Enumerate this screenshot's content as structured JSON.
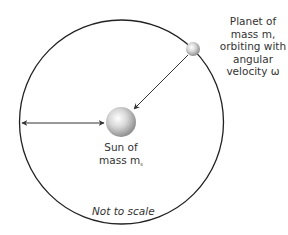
{
  "diagram": {
    "planet_label_lines": [
      "Planet of",
      "mass m,",
      "orbiting with",
      "angular",
      "velocity ω"
    ],
    "sun_label_lines": [
      "Sun of",
      "mass m"
    ],
    "sun_mass_subscript": "s",
    "scale_note": "Not to scale",
    "shapes": {
      "orbit": {
        "cx": 121.5,
        "cy": 122,
        "r": 102
      },
      "sun": {
        "cx": 121,
        "cy": 122,
        "r": 15
      },
      "planet": {
        "cx": 193,
        "cy": 49,
        "r": 7
      }
    },
    "colors": {
      "orbit_stroke": "#222222",
      "arrow_stroke": "#333333",
      "sphere_light": "#ffffff",
      "sphere_dark": "#8a8a8a"
    }
  }
}
